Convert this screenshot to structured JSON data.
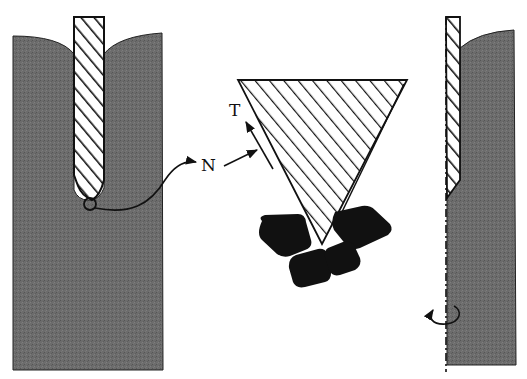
{
  "diagram": {
    "colors": {
      "workpiece": "#6e6e6e",
      "workpiece_dark": "#5a5a5a",
      "tool_fill": "#ffffff",
      "hatch": "#111111",
      "grain": "#111111",
      "stroke": "#111111"
    },
    "panels": [
      {
        "id": "left",
        "name": "tool-in-bore",
        "elements": [
          "workpiece-block",
          "hatched-tool",
          "contact-circle"
        ]
      },
      {
        "id": "center",
        "name": "enlarged-cutting-edge",
        "elements": [
          "hatched-wedge",
          "abrasive-grains",
          "force-arrows"
        ]
      },
      {
        "id": "right",
        "name": "rotating-tool-section",
        "elements": [
          "workpiece-block",
          "hatched-tool-half",
          "rotation-axis",
          "rotation-arrow"
        ]
      }
    ],
    "labels": {
      "normal_force": "N",
      "tangential_force": "T"
    },
    "grain_count": 4
  }
}
